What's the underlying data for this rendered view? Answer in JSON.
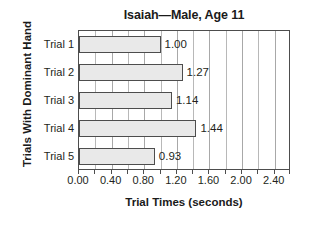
{
  "chart_data": {
    "type": "bar",
    "orientation": "horizontal",
    "title": "Isaiah—Male, Age 11",
    "xlabel": "Trial Times (seconds)",
    "ylabel": "Trials With Dominant Hand",
    "categories": [
      "Trial 1",
      "Trial 2",
      "Trial 3",
      "Trial 4",
      "Trial 5"
    ],
    "values": [
      1.0,
      1.27,
      1.14,
      1.44,
      0.93
    ],
    "value_labels": [
      "1.00",
      "1.27",
      "1.14",
      "1.44",
      "0.93"
    ],
    "xlim": [
      0.0,
      2.6
    ],
    "xticks": [
      0.0,
      0.4,
      0.8,
      1.2,
      1.6,
      2.0,
      2.4
    ],
    "xtick_labels": [
      "0.00",
      "0.40",
      "0.80",
      "1.20",
      "1.60",
      "2.00",
      "2.40"
    ],
    "minor_tick_step": 0.2,
    "grid": "vertical-minor",
    "legend": "none",
    "bar_fill_color": "#e9e9e9",
    "bar_border_color": "#4d4d4d",
    "gridline_color": "#b8b8b8",
    "axis_color": "#4d4d4d",
    "background_color": "#ffffff",
    "text_color": "#231f20"
  }
}
